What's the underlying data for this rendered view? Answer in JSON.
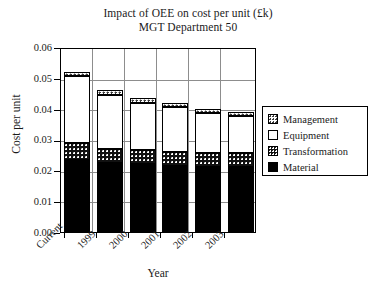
{
  "chart_data": {
    "type": "bar",
    "stacked": true,
    "title": "Impact of OEE on cost per unit (£k)",
    "subtitle": "MGT Department 50",
    "xlabel": "Year",
    "ylabel": "Cost per unit",
    "categories": [
      "Current",
      "1999",
      "2000",
      "2001",
      "2002",
      "2003"
    ],
    "ylim": [
      0.0,
      0.06
    ],
    "ytick_labels": [
      "0.00",
      "0.01",
      "0.02",
      "0.03",
      "0.04",
      "0.05",
      "0.06"
    ],
    "ytick_values": [
      0.0,
      0.01,
      0.02,
      0.03,
      0.04,
      0.05,
      0.06
    ],
    "grid": true,
    "legend_position": "right",
    "series": [
      {
        "name": "Material",
        "fill": "solid-black",
        "values": [
          0.0235,
          0.0225,
          0.022,
          0.0215,
          0.021,
          0.021
        ]
      },
      {
        "name": "Transformation",
        "fill": "dark-dotted",
        "values": [
          0.0055,
          0.0045,
          0.0045,
          0.0045,
          0.0045,
          0.0045
        ]
      },
      {
        "name": "Equipment",
        "fill": "white",
        "values": [
          0.0215,
          0.0175,
          0.0155,
          0.0145,
          0.013,
          0.012
        ]
      },
      {
        "name": "Management",
        "fill": "light-dotted",
        "values": [
          0.0015,
          0.0015,
          0.0015,
          0.0015,
          0.0015,
          0.0015
        ]
      }
    ],
    "totals": [
      0.052,
      0.0485,
      0.0465,
      0.044,
      0.043,
      0.042
    ],
    "legend_entries": [
      "Management",
      "Equipment",
      "Transformation",
      "Material"
    ],
    "colors": {
      "material": "#000000",
      "equipment": "#ffffff",
      "transformation": "#111111",
      "management": "#ffffff",
      "axis": "#000000",
      "grid": "#8d8d8d",
      "background": "#ffffff"
    }
  }
}
